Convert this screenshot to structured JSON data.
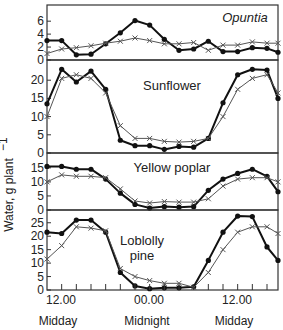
{
  "chart_data": {
    "type": "line",
    "ylabel": "Water, g plant⁻¹",
    "x_tick_labels": [
      {
        "label": "12.00",
        "sublabel": "Midday",
        "hour": 12
      },
      {
        "label": "00.00",
        "sublabel": "Midnight",
        "hour": 24
      },
      {
        "label": "12.00",
        "sublabel": "Midday",
        "hour": 36
      }
    ],
    "x_hours": [
      10,
      12,
      14,
      16,
      18,
      20,
      22,
      24,
      26,
      28,
      30,
      32,
      34,
      36,
      38,
      40,
      41.5
    ],
    "series_styles": {
      "solid": "filled circles, solid thick line",
      "cross": "crosses, thin dashed line"
    },
    "panels": [
      {
        "title": "Opuntia",
        "italic": true,
        "yticks": [
          0,
          2,
          4,
          6
        ],
        "ylim": [
          0,
          8.5
        ],
        "series": [
          {
            "name": "solid",
            "values": [
              3.0,
              3.0,
              0.8,
              0.9,
              2.5,
              4.2,
              6.1,
              5.4,
              3.2,
              1.5,
              1.7,
              2.9,
              1.3,
              1.3,
              1.9,
              1.8,
              1.2
            ]
          },
          {
            "name": "cross",
            "values": [
              1.0,
              1.7,
              1.9,
              2.2,
              2.6,
              2.9,
              3.4,
              3.0,
              2.5,
              2.5,
              2.7,
              1.5,
              2.3,
              2.3,
              2.8,
              2.6,
              2.6
            ]
          }
        ]
      },
      {
        "title": "Sunflower",
        "italic": false,
        "yticks": [
          0,
          5,
          10,
          15,
          20
        ],
        "ylim": [
          0,
          25
        ],
        "series": [
          {
            "name": "solid",
            "values": [
              13.5,
              23.0,
              19.5,
              22.5,
              17.5,
              3.5,
              2.0,
              2.0,
              1.0,
              1.8,
              1.6,
              4.0,
              13.8,
              21.5,
              23.0,
              22.8,
              15.0
            ]
          },
          {
            "name": "cross",
            "values": [
              10.0,
              20.5,
              21.5,
              20.5,
              16.5,
              7.5,
              4.0,
              4.0,
              3.2,
              3.0,
              3.2,
              4.0,
              10.0,
              17.5,
              20.5,
              21.5,
              16.5
            ]
          }
        ]
      },
      {
        "title": "Yellow poplar",
        "italic": false,
        "yticks": [
          0,
          5,
          10,
          15
        ],
        "ylim": [
          0,
          18.5
        ],
        "series": [
          {
            "name": "solid",
            "values": [
              15.5,
              15.5,
              14.5,
              14.5,
              11.0,
              6.0,
              2.0,
              0.7,
              1.2,
              1.0,
              1.2,
              7.0,
              11.0,
              13.0,
              14.5,
              12.0,
              6.5
            ]
          },
          {
            "name": "cross",
            "values": [
              10.0,
              12.5,
              12.0,
              12.0,
              11.5,
              7.5,
              3.2,
              2.5,
              3.0,
              2.8,
              2.8,
              4.0,
              8.5,
              11.0,
              11.5,
              11.5,
              10.0
            ]
          }
        ]
      },
      {
        "title": "Loblolly pine",
        "title_lines": [
          "Loblolly",
          "pine"
        ],
        "italic": false,
        "yticks": [
          0,
          5,
          10,
          15,
          20,
          25
        ],
        "ylim": [
          0,
          29
        ],
        "series": [
          {
            "name": "solid",
            "values": [
              21.5,
              21.0,
              26.0,
              26.0,
              21.5,
              6.5,
              1.5,
              0.5,
              0.8,
              0.8,
              1.2,
              11.0,
              21.5,
              27.5,
              27.3,
              16.0,
              11.0
            ]
          },
          {
            "name": "cross",
            "values": [
              11.5,
              16.5,
              23.5,
              23.0,
              22.0,
              8.0,
              5.0,
              3.5,
              2.5,
              2.5,
              1.0,
              6.5,
              15.0,
              21.5,
              23.5,
              23.5,
              21.0
            ]
          }
        ]
      }
    ],
    "grid": false,
    "legend": "none"
  },
  "labels": {
    "ylabel": "Water, g plant",
    "ylabel_sup": "−1",
    "x1": "12.00",
    "x2": "00.00",
    "x3": "12.00",
    "x1_sub": "Midday",
    "x2_sub": "Midnight",
    "x3_sub": "Midday",
    "p1": "Opuntia",
    "p2": "Sunflower",
    "p3": "Yellow poplar",
    "p4a": "Loblolly",
    "p4b": "pine"
  }
}
